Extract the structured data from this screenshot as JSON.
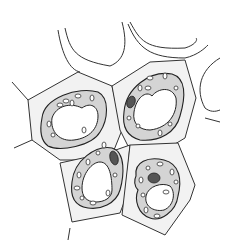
{
  "diagram": {
    "type": "biological illustration",
    "cells": [
      {
        "id": "cell-upper-left",
        "has_nucleus": false
      },
      {
        "id": "cell-upper-right",
        "has_nucleus": true
      },
      {
        "id": "cell-lower-left",
        "has_nucleus": true
      },
      {
        "id": "cell-lower-right",
        "has_nucleus": true
      }
    ],
    "colors": {
      "wall": "#f2f2f2",
      "outline": "#333333",
      "cytoplasm": "#d4d4d4",
      "nucleus": "#555555"
    }
  }
}
